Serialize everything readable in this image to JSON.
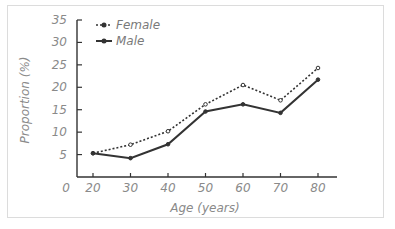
{
  "chart_data": {
    "type": "line",
    "title": "",
    "xlabel": "Age (years)",
    "ylabel": "Proportion (%)",
    "x": [
      20,
      30,
      40,
      50,
      60,
      70,
      80
    ],
    "x_ticks": [
      "0",
      "20",
      "30",
      "40",
      "50",
      "60",
      "70",
      "80"
    ],
    "y_ticks": [
      "5",
      "10",
      "15",
      "20",
      "25",
      "30",
      "35"
    ],
    "ylim": [
      0,
      35
    ],
    "grid": false,
    "legend_position": "top-left",
    "series": [
      {
        "name": "Female",
        "style": "dotted",
        "marker": "open-circle",
        "color": "#333333",
        "values": [
          5.3,
          7.2,
          10.2,
          16.2,
          20.5,
          17.1,
          24.3
        ]
      },
      {
        "name": "Male",
        "style": "solid",
        "marker": "filled-circle",
        "color": "#333333",
        "values": [
          5.3,
          4.2,
          7.3,
          14.6,
          16.2,
          14.3,
          21.7
        ]
      }
    ]
  },
  "legend": {
    "female_label": "Female",
    "male_label": "Male"
  },
  "axes": {
    "xlabel": "Age (years)",
    "ylabel": "Proportion (%)",
    "origin_label": "0"
  }
}
